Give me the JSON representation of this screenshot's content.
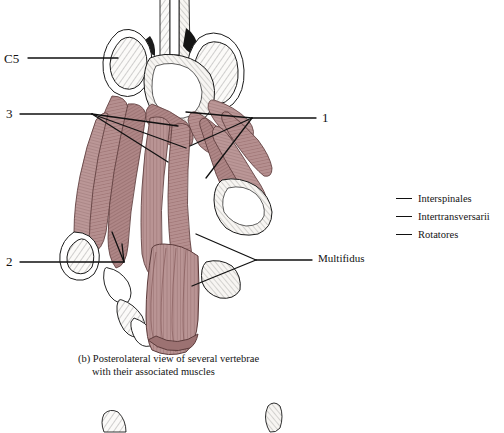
{
  "figure": {
    "caption_line1": "(b) Posterolateral view of several vertebrae",
    "caption_line2": "with their associated muscles"
  },
  "labels": [
    {
      "id": "c5",
      "text": "C5",
      "x": 4,
      "y": 52
    },
    {
      "id": "three",
      "text": "3",
      "x": 6,
      "y": 108
    },
    {
      "id": "two",
      "text": "2",
      "x": 6,
      "y": 254
    },
    {
      "id": "one",
      "text": "1",
      "x": 322,
      "y": 112
    },
    {
      "id": "multifidus",
      "text": "Multifidus",
      "x": 318,
      "y": 254
    }
  ],
  "legend": {
    "items": [
      {
        "label": "Interspinales"
      },
      {
        "label": "Intertransversarii"
      },
      {
        "label": "Rotatores"
      }
    ]
  },
  "colors": {
    "muscle": "#b58f8f",
    "muscle_dark": "#8d6464",
    "bone": "#fbfaf8",
    "ink": "#1a1a1a",
    "background": "#ffffff"
  }
}
